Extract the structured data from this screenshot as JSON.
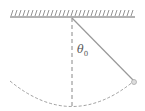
{
  "diagram": {
    "type": "pendulum",
    "angle_label": "θ",
    "angle_subscript": "0",
    "colors": {
      "line": "#888888",
      "string": "#999999",
      "bob": "#aaaaaa",
      "background": "#ffffff"
    }
  }
}
